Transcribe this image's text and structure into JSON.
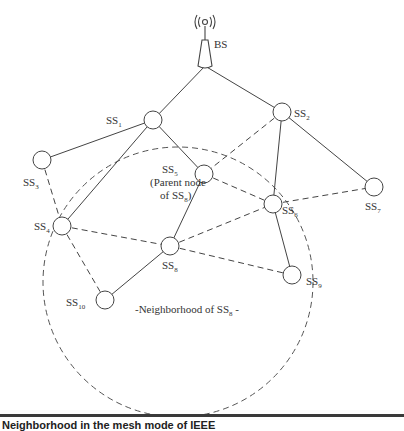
{
  "diagram": {
    "base_station": {
      "label": "BS",
      "icon": "antenna-tower-icon",
      "x": 205,
      "y": 50
    },
    "nodes": [
      {
        "id": "SS1",
        "base": "SS",
        "sub": "1",
        "x": 153,
        "y": 120,
        "lx": 106,
        "ly": 124
      },
      {
        "id": "SS2",
        "base": "SS",
        "sub": "2",
        "x": 282,
        "y": 112,
        "lx": 294,
        "ly": 117
      },
      {
        "id": "SS3",
        "base": "SS",
        "sub": "3",
        "x": 42,
        "y": 160,
        "lx": 23,
        "ly": 186
      },
      {
        "id": "SS4",
        "base": "SS",
        "sub": "4",
        "x": 62,
        "y": 226,
        "lx": 34,
        "ly": 230
      },
      {
        "id": "SS5",
        "base": "SS",
        "sub": "5",
        "x": 204,
        "y": 174,
        "lx": 162,
        "ly": 173
      },
      {
        "id": "SS6",
        "base": "SS",
        "sub": "6",
        "x": 273,
        "y": 204,
        "lx": 282,
        "ly": 214
      },
      {
        "id": "SS7",
        "base": "SS",
        "sub": "7",
        "x": 374,
        "y": 187,
        "lx": 365,
        "ly": 210
      },
      {
        "id": "SS8",
        "base": "SS",
        "sub": "8",
        "x": 170,
        "y": 246,
        "lx": 162,
        "ly": 269
      },
      {
        "id": "SS9",
        "base": "SS",
        "sub": "9",
        "x": 292,
        "y": 275,
        "lx": 306,
        "ly": 285
      },
      {
        "id": "SS10",
        "base": "SS",
        "sub": "10",
        "x": 105,
        "y": 300,
        "lx": 66,
        "ly": 306
      }
    ],
    "parent_note": {
      "line1": "(Parent node",
      "line2_prefix": "of SS",
      "line2_sub": "8",
      "line2_suffix": ")"
    },
    "neighborhood_label": {
      "prefix": "-Neighborhood of SS",
      "sub": "8",
      "suffix": " -"
    },
    "neighborhood_circle": {
      "cx": 178,
      "cy": 282,
      "r": 135
    },
    "solid_links": [
      [
        "BS",
        "SS1"
      ],
      [
        "BS",
        "SS2"
      ],
      [
        "SS1",
        "SS3"
      ],
      [
        "SS1",
        "SS4"
      ],
      [
        "SS1",
        "SS5"
      ],
      [
        "SS2",
        "SS6"
      ],
      [
        "SS2",
        "SS7"
      ],
      [
        "SS5",
        "SS8"
      ],
      [
        "SS6",
        "SS9"
      ],
      [
        "SS8",
        "SS10"
      ]
    ],
    "dashed_links": [
      [
        "SS2",
        "SS5"
      ],
      [
        "SS5",
        "SS6"
      ],
      [
        "SS6",
        "SS7"
      ],
      [
        "SS3",
        "SS4"
      ],
      [
        "SS4",
        "SS8"
      ],
      [
        "SS4",
        "SS10"
      ],
      [
        "SS8",
        "SS6"
      ],
      [
        "SS8",
        "SS9"
      ]
    ]
  },
  "caption": {
    "text": "Neighborhood in the mesh mode of IEEE"
  }
}
